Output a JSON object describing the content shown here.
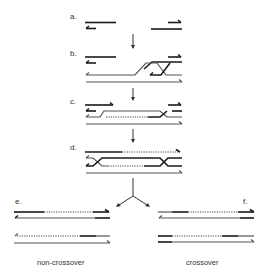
{
  "diagram": {
    "type": "dsb-repair-recombination",
    "colors": {
      "strand_dark": "#1a1a1a",
      "strand_gray": "#555555",
      "background": "#ffffff"
    },
    "steps": [
      {
        "id": "a",
        "label": "a."
      },
      {
        "id": "b",
        "label": "b."
      },
      {
        "id": "c",
        "label": "c."
      },
      {
        "id": "d",
        "label": "d."
      },
      {
        "id": "e",
        "label": "e."
      },
      {
        "id": "f",
        "label": "f."
      }
    ],
    "outcomes": {
      "left": "non-crossover",
      "right": "crossover"
    }
  }
}
